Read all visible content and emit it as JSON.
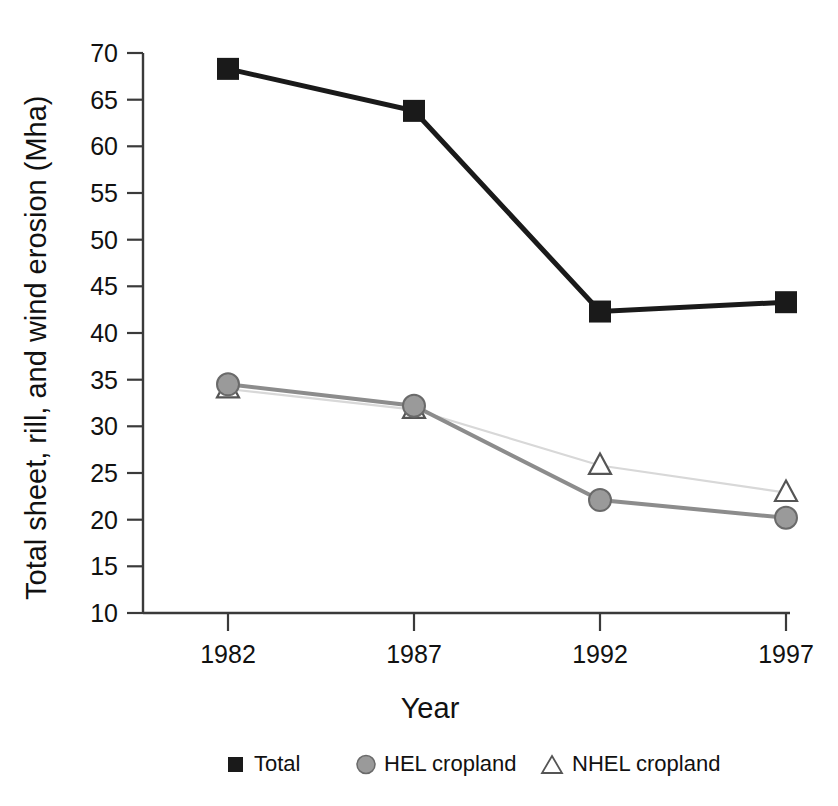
{
  "chart_data": {
    "type": "line",
    "title": "",
    "xlabel": "Year",
    "ylabel": "Total sheet, rill, and wind erosion (Mha)",
    "categories": [
      "1982",
      "1987",
      "1992",
      "1997"
    ],
    "x": [
      1982,
      1987,
      1992,
      1997
    ],
    "xlim": [
      1980.7,
      1998.3
    ],
    "ylim": [
      10,
      70
    ],
    "yticks": [
      10,
      15,
      20,
      25,
      30,
      35,
      40,
      45,
      50,
      55,
      60,
      65,
      70
    ],
    "ytick_labels": [
      "10",
      "15",
      "20",
      "25",
      "30",
      "35",
      "40",
      "45",
      "50",
      "55",
      "60",
      "65",
      "70"
    ],
    "xticks": [
      1982,
      1987,
      1992,
      1997
    ],
    "xtick_labels": [
      "1982",
      "1987",
      "1992",
      "1997"
    ],
    "grid": false,
    "legend_position": "bottom",
    "series": [
      {
        "name": "Total",
        "marker": "square",
        "marker_color": "#1a1a1a",
        "line_color": "#1a1a1a",
        "line_width": 4.5,
        "values": [
          68.3,
          63.8,
          42.3,
          43.3
        ]
      },
      {
        "name": "HEL cropland",
        "marker": "circle",
        "marker_color": "#8c8c8c",
        "line_color": "#8c8c8c",
        "line_width": 3,
        "values": [
          34.5,
          32.2,
          22.1,
          20.2
        ]
      },
      {
        "name": "NHEL cropland",
        "marker": "triangle",
        "marker_color": "#ffffff",
        "line_color": "#d8d8d8",
        "line_width": 1.6,
        "values": [
          34.0,
          31.8,
          25.8,
          22.9
        ]
      }
    ]
  },
  "axes": {
    "y_title": "Total sheet, rill, and wind erosion (Mha)",
    "x_title": "Year",
    "y_ticks": [
      "70",
      "65",
      "60",
      "55",
      "50",
      "45",
      "40",
      "35",
      "30",
      "25",
      "20",
      "15",
      "10"
    ],
    "x_ticks": [
      "1982",
      "1987",
      "1992",
      "1997"
    ]
  },
  "legend": {
    "items": [
      {
        "label": "Total",
        "marker": "square-marker"
      },
      {
        "label": "HEL cropland",
        "marker": "circle-marker"
      },
      {
        "label": "NHEL cropland",
        "marker": "triangle-marker"
      }
    ]
  },
  "colors": {
    "total": "#1a1a1a",
    "hel": "#8c8c8c",
    "nhel_line": "#d8d8d8",
    "nhel_marker_edge": "#555555",
    "axis": "#3a3a3a",
    "text": "#111111",
    "background": "#ffffff"
  }
}
